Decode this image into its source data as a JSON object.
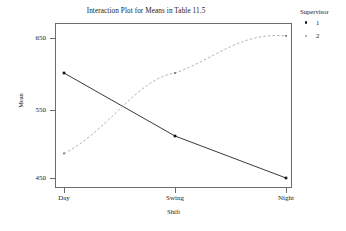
{
  "chart_data": {
    "type": "line",
    "title": "Interaction Plot for Means in Table 11.5",
    "xlabel": "Shift",
    "ylabel": "Mean",
    "categories": [
      "Day",
      "Swing",
      "Night"
    ],
    "yticks": [
      450,
      550,
      650
    ],
    "ylim": [
      430,
      670
    ],
    "grid": false,
    "legend_position": "right",
    "legend_title": "Supervisor",
    "series": [
      {
        "name": "1",
        "style": "solid",
        "color": "#222222",
        "marker": "filled-square",
        "values": [
          600,
          510,
          450
        ]
      },
      {
        "name": "2",
        "style": "dashed",
        "color": "#9a9a9a",
        "marker": "small-square",
        "values": [
          485,
          600,
          653
        ]
      }
    ]
  },
  "axes": {
    "ytick_labels": [
      "650",
      "550",
      "450"
    ],
    "xtick_labels": [
      "Day",
      "Swing",
      "Night"
    ],
    "y_axis_title": "Mean",
    "x_axis_title": "Shift"
  },
  "legend": {
    "title": "Supervisor",
    "items": [
      {
        "label": "1",
        "marker": "filled-square-dark"
      },
      {
        "label": "2",
        "marker": "small-square-light"
      }
    ]
  },
  "title": "Interaction Plot for Means in Table 11.5",
  "colors": {
    "series1": "#222222",
    "series2": "#9a9a9a",
    "frame": "#6b6b6b",
    "text": "#1a1a1a",
    "background": "#ffffff"
  }
}
